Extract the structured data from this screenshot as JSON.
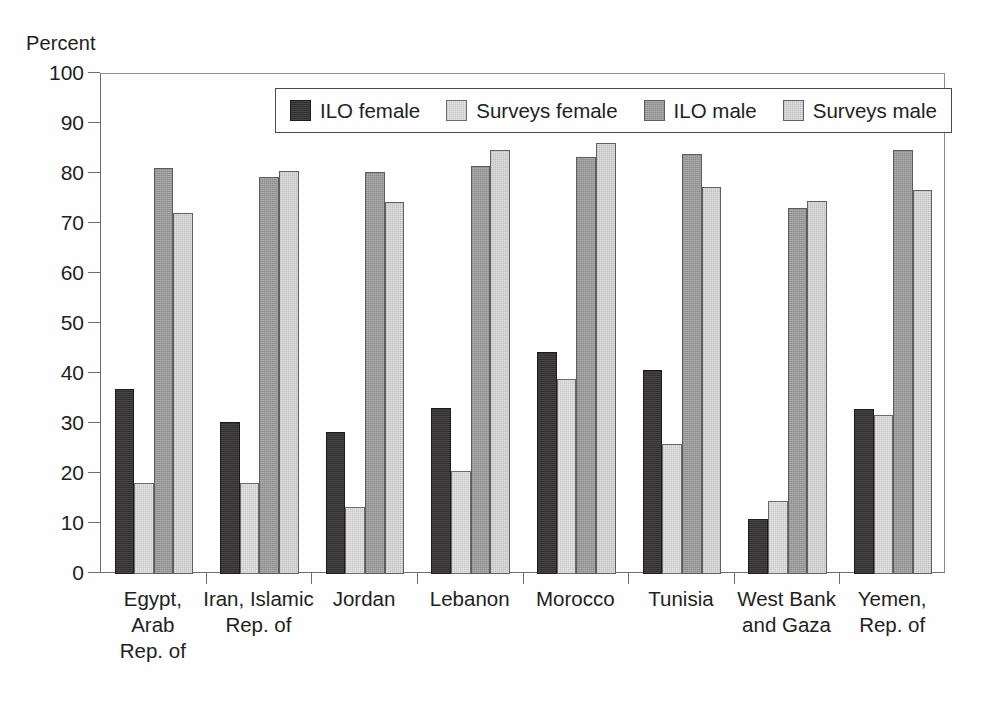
{
  "chart_data": {
    "type": "bar",
    "title": "",
    "xlabel": "",
    "ylabel": "Percent",
    "ylim": [
      0,
      100
    ],
    "ytick_step": 10,
    "yticks": [
      0,
      10,
      20,
      30,
      40,
      50,
      60,
      70,
      80,
      90,
      100
    ],
    "grid": false,
    "legend_position": "top-center-inside",
    "categories": [
      "Egypt, Arab Rep. of",
      "Iran, Islamic Rep. of",
      "Jordan",
      "Lebanon",
      "Morocco",
      "Tunisia",
      "West Bank and Gaza",
      "Yemen, Rep. of"
    ],
    "category_lines": [
      [
        "Egypt,",
        "Arab",
        "Rep. of"
      ],
      [
        "Iran, Islamic",
        "Rep. of"
      ],
      [
        "Jordan"
      ],
      [
        "Lebanon"
      ],
      [
        "Morocco"
      ],
      [
        "Tunisia"
      ],
      [
        "West Bank",
        "and Gaza"
      ],
      [
        "Yemen,",
        "Rep. of"
      ]
    ],
    "series": [
      {
        "name": "ILO female",
        "color": "#333132",
        "values": [
          37.0,
          30.5,
          28.5,
          33.2,
          44.5,
          40.8,
          11.0,
          33.1
        ]
      },
      {
        "name": "Surveys female",
        "color": "#dddcdc",
        "values": [
          18.2,
          18.3,
          13.5,
          20.7,
          39.0,
          26.1,
          14.6,
          31.9
        ]
      },
      {
        "name": "ILO male",
        "color": "#9a9a9a",
        "values": [
          81.2,
          79.5,
          80.4,
          81.6,
          83.4,
          84.0,
          73.3,
          84.8
        ]
      },
      {
        "name": "Surveys male",
        "color": "#d4d4d4",
        "values": [
          72.2,
          80.6,
          74.5,
          84.8,
          86.3,
          77.4,
          74.6,
          76.9
        ]
      }
    ]
  },
  "axis": {
    "y_title": "Percent"
  }
}
